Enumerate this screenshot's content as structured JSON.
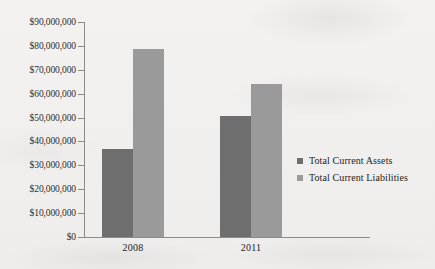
{
  "chart_data": {
    "type": "bar",
    "title": "",
    "xlabel": "",
    "ylabel": "",
    "categories": [
      "2008",
      "2011"
    ],
    "series": [
      {
        "name": "Total Current Assets",
        "color": "#6e6e6e",
        "values": [
          37000000,
          50500000
        ]
      },
      {
        "name": "Total Current Liabilities",
        "color": "#9a9a9a",
        "values": [
          78500000,
          64000000
        ]
      }
    ],
    "ylim": [
      0,
      90000000
    ],
    "ytick_step": 10000000,
    "ytick_labels": [
      "$90,000,000",
      "$80,000,000",
      "$70,000,000",
      "$60,000,000",
      "$50,000,000",
      "$40,000,000",
      "$30,000,000",
      "$20,000,000",
      "$10,000,000",
      "$0"
    ],
    "grid": false,
    "legend_position": "right"
  },
  "legend": {
    "items": [
      {
        "label": "Total Current Assets"
      },
      {
        "label": "Total Current Liabilities"
      }
    ]
  }
}
